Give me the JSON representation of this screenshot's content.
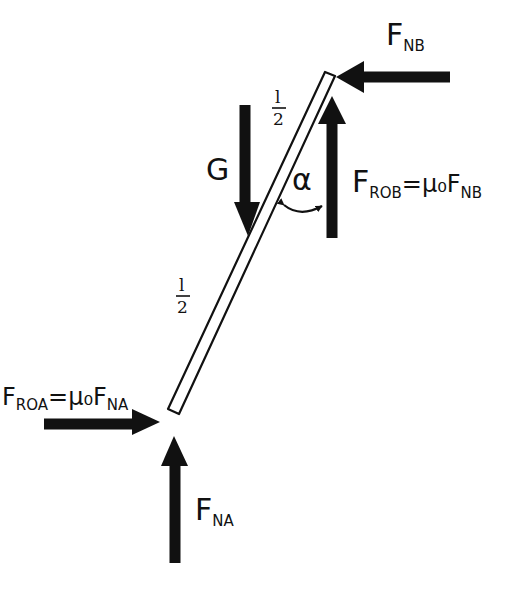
{
  "diagram": {
    "type": "free-body diagram",
    "colors": {
      "ink": "#111111",
      "background": "#ffffff"
    },
    "rod": {
      "top": [
        330,
        74
      ],
      "bottom": [
        174,
        411
      ]
    },
    "forces": [
      {
        "id": "fnb",
        "main": "F",
        "sub": "NB",
        "rest": "",
        "direction": "left"
      },
      {
        "id": "frob",
        "main": "F",
        "sub": "ROB",
        "rest": "=μ₀F",
        "rest_sub": "NB",
        "direction": "up"
      },
      {
        "id": "g",
        "main": "G",
        "sub": "",
        "rest": "",
        "direction": "down"
      },
      {
        "id": "froa",
        "main": "F",
        "sub": "ROA",
        "rest": "=μ₀F",
        "rest_sub": "NA",
        "direction": "right"
      },
      {
        "id": "fna",
        "main": "F",
        "sub": "NA",
        "rest": "",
        "direction": "up"
      }
    ],
    "length_labels": [
      {
        "num": "l",
        "den": "2",
        "position": "upper half"
      },
      {
        "num": "l",
        "den": "2",
        "position": "lower half"
      }
    ],
    "angle_label": "α"
  }
}
